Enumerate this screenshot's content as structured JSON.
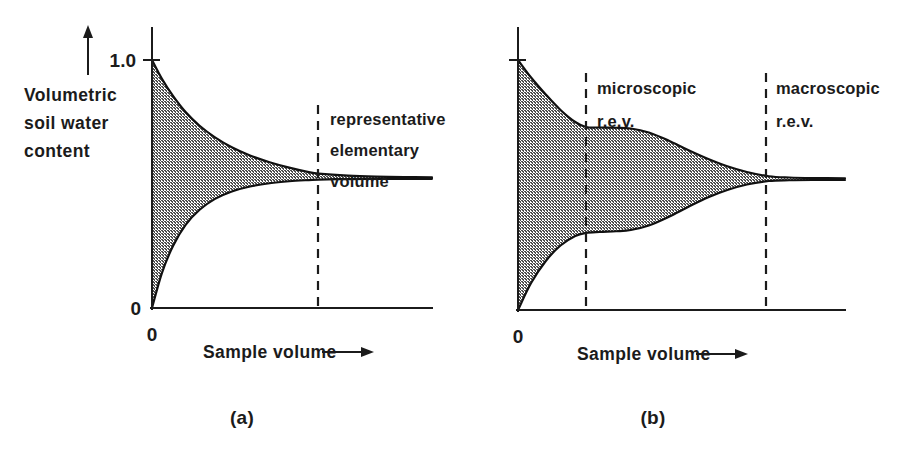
{
  "figure": {
    "background_color": "#ffffff",
    "ink_color": "#1b1b1b",
    "fill_color": "#aaaaaa",
    "caption_a": "(a)",
    "caption_b": "(b)"
  },
  "panel_a": {
    "y_axis_label_lines": [
      "Volumetric",
      "soil water",
      "content"
    ],
    "y_axis_arrow": "up-arrow",
    "y_tick_top_label": "1.0",
    "y_tick_zero_label": "0",
    "x_origin_label": "0",
    "x_axis_label": "Sample volume",
    "x_axis_arrow": "right-arrow",
    "annotation_lines": [
      "representative",
      "elementary",
      "volume"
    ],
    "dashed_marker_name": "representative-elementary-volume"
  },
  "panel_b": {
    "x_origin_label": "0",
    "x_axis_label": "Sample volume",
    "x_axis_arrow": "right-arrow",
    "annotation_micro_lines": [
      "microscopic",
      "r.e.v."
    ],
    "annotation_macro_lines": [
      "macroscopic",
      "r.e.v."
    ],
    "dashed_marker_micro_name": "microscopic-rev",
    "dashed_marker_macro_name": "macroscopic-rev"
  },
  "chart_data": {
    "type": "area",
    "panels": [
      {
        "id": "a",
        "caption": "(a)",
        "xlabel": "Sample volume",
        "ylabel": "Volumetric soil water content",
        "ylim": [
          0,
          1.0
        ],
        "xlim": [
          0,
          1.0
        ],
        "y_ticks": [
          0,
          1.0
        ],
        "y_tick_labels": [
          "0",
          "1.0"
        ],
        "x_ticks": [
          0
        ],
        "x_tick_labels": [
          "0"
        ],
        "grid": false,
        "legend": "none",
        "converged_value": 0.52,
        "markers": [
          {
            "name": "representative elementary volume",
            "x": 0.595,
            "label_lines": [
              "representative",
              "elementary",
              "volume"
            ],
            "style": "dashed-vertical"
          }
        ],
        "series": [
          {
            "name": "upper envelope",
            "x": [
              0.0,
              0.035,
              0.075,
              0.12,
              0.17,
              0.225,
              0.285,
              0.35,
              0.42,
              0.49,
              0.56,
              0.595,
              0.7,
              0.8,
              0.9,
              1.0
            ],
            "y": [
              1.0,
              0.925,
              0.855,
              0.79,
              0.735,
              0.688,
              0.648,
              0.615,
              0.588,
              0.566,
              0.548,
              0.542,
              0.534,
              0.53,
              0.528,
              0.527
            ]
          },
          {
            "name": "lower envelope",
            "x": [
              0.0,
              0.035,
              0.075,
              0.12,
              0.17,
              0.225,
              0.285,
              0.35,
              0.42,
              0.49,
              0.56,
              0.595,
              0.7,
              0.8,
              0.9,
              1.0
            ],
            "y": [
              0.0,
              0.14,
              0.25,
              0.335,
              0.396,
              0.44,
              0.47,
              0.49,
              0.503,
              0.511,
              0.516,
              0.518,
              0.52,
              0.521,
              0.521,
              0.521
            ]
          }
        ]
      },
      {
        "id": "b",
        "caption": "(b)",
        "xlabel": "Sample volume",
        "ylabel": "Volumetric soil water content",
        "ylim": [
          0,
          1.0
        ],
        "xlim": [
          0,
          1.0
        ],
        "y_ticks": [
          1.0
        ],
        "y_tick_labels": [
          ""
        ],
        "x_ticks": [
          0
        ],
        "x_tick_labels": [
          "0"
        ],
        "grid": false,
        "legend": "none",
        "converged_value": 0.52,
        "markers": [
          {
            "name": "microscopic r.e.v.",
            "x": 0.208,
            "label_lines": [
              "microscopic",
              "r.e.v."
            ],
            "style": "dashed-vertical"
          },
          {
            "name": "macroscopic r.e.v.",
            "x": 0.767,
            "label_lines": [
              "macroscopic",
              "r.e.v."
            ],
            "style": "dashed-vertical"
          }
        ],
        "series": [
          {
            "name": "upper envelope",
            "x": [
              0.0,
              0.04,
              0.085,
              0.13,
              0.175,
              0.208,
              0.25,
              0.3,
              0.345,
              0.4,
              0.46,
              0.52,
              0.58,
              0.64,
              0.7,
              0.767,
              0.83,
              0.9,
              1.0
            ],
            "y": [
              1.0,
              0.93,
              0.862,
              0.8,
              0.752,
              0.732,
              0.73,
              0.729,
              0.726,
              0.71,
              0.678,
              0.64,
              0.605,
              0.575,
              0.552,
              0.535,
              0.53,
              0.528,
              0.527
            ]
          },
          {
            "name": "lower envelope",
            "x": [
              0.0,
              0.04,
              0.085,
              0.13,
              0.175,
              0.208,
              0.25,
              0.3,
              0.345,
              0.4,
              0.46,
              0.52,
              0.58,
              0.64,
              0.7,
              0.767,
              0.83,
              0.9,
              1.0
            ],
            "y": [
              0.0,
              0.108,
              0.196,
              0.258,
              0.296,
              0.308,
              0.312,
              0.315,
              0.32,
              0.338,
              0.372,
              0.412,
              0.45,
              0.48,
              0.502,
              0.516,
              0.519,
              0.52,
              0.52
            ]
          }
        ]
      }
    ]
  }
}
